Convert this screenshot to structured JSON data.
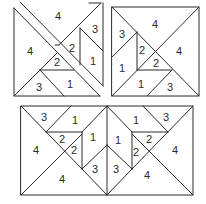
{
  "figures": [
    {
      "name": "split-square",
      "labels": [
        {
          "text": "4",
          "x": 58,
          "y": 17
        },
        {
          "text": "3",
          "x": 95,
          "y": 30
        },
        {
          "text": "4",
          "x": 30,
          "y": 52
        },
        {
          "text": "2",
          "x": 72,
          "y": 49
        },
        {
          "text": "1",
          "x": 93,
          "y": 62
        },
        {
          "text": "2",
          "x": 57,
          "y": 63
        },
        {
          "text": "3",
          "x": 39,
          "y": 88
        },
        {
          "text": "1",
          "x": 70,
          "y": 85
        }
      ]
    },
    {
      "name": "square",
      "labels": [
        {
          "text": "4",
          "x": 155,
          "y": 25
        },
        {
          "text": "3",
          "x": 122,
          "y": 35
        },
        {
          "text": "2",
          "x": 142,
          "y": 51
        },
        {
          "text": "4",
          "x": 179,
          "y": 52
        },
        {
          "text": "2",
          "x": 156,
          "y": 64
        },
        {
          "text": "1",
          "x": 122,
          "y": 69
        },
        {
          "text": "1",
          "x": 141,
          "y": 85
        },
        {
          "text": "3",
          "x": 170,
          "y": 88
        }
      ]
    },
    {
      "name": "rectangle",
      "labels": [
        {
          "text": "3",
          "x": 44,
          "y": 118
        },
        {
          "text": "1",
          "x": 75,
          "y": 121
        },
        {
          "text": "1",
          "x": 136,
          "y": 121
        },
        {
          "text": "3",
          "x": 166,
          "y": 118
        },
        {
          "text": "2",
          "x": 62,
          "y": 140
        },
        {
          "text": "1",
          "x": 93,
          "y": 138
        },
        {
          "text": "1",
          "x": 118,
          "y": 141
        },
        {
          "text": "2",
          "x": 149,
          "y": 140
        },
        {
          "text": "4",
          "x": 36,
          "y": 151
        },
        {
          "text": "2",
          "x": 74,
          "y": 151
        },
        {
          "text": "2",
          "x": 136,
          "y": 153
        },
        {
          "text": "4",
          "x": 175,
          "y": 151
        },
        {
          "text": "3",
          "x": 95,
          "y": 170
        },
        {
          "text": "3",
          "x": 116,
          "y": 170
        },
        {
          "text": "4",
          "x": 62,
          "y": 180
        },
        {
          "text": "4",
          "x": 147,
          "y": 176
        }
      ]
    }
  ]
}
